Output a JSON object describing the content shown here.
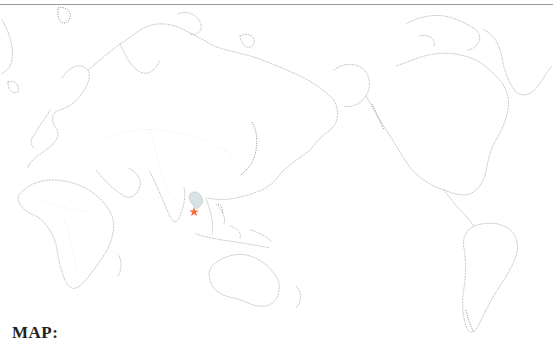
{
  "label": "MAP:",
  "map": {
    "projection": "Pacific-centered world map",
    "highlighted_region": "Thailand",
    "highlight_color": "#d8e2e6",
    "marker": {
      "icon": "star-icon",
      "color": "#f26a3a",
      "x": 194,
      "y": 212
    },
    "outline_color": "#b8b8b8"
  }
}
